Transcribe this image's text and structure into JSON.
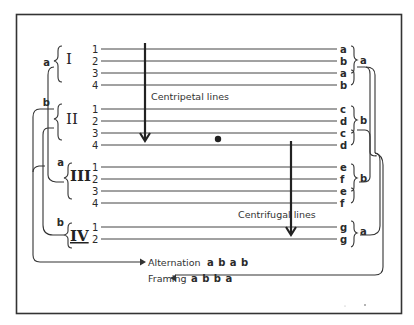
{
  "diagram": {
    "title": "",
    "groups": [
      {
        "roman": "I",
        "left_label": "a",
        "lines": [
          "1",
          "2",
          "3",
          "4"
        ],
        "rhymes": [
          "a",
          "b",
          "a",
          "b"
        ],
        "right_label": "a"
      },
      {
        "roman": "II",
        "left_label": "b",
        "lines": [
          "1",
          "2",
          "3",
          "4"
        ],
        "rhymes": [
          "c",
          "d",
          "c",
          "d"
        ],
        "right_label": "b"
      },
      {
        "roman": "III",
        "left_label": "a",
        "lines": [
          "1",
          "2",
          "3",
          "4"
        ],
        "rhymes": [
          "e",
          "f",
          "e",
          "f"
        ],
        "right_label": "b"
      },
      {
        "roman": "IV",
        "left_label": "b",
        "lines": [
          "1",
          "2"
        ],
        "rhymes": [
          "g",
          "g"
        ],
        "right_label": "a"
      }
    ],
    "annotations": {
      "centripetal": "Centripetal lines",
      "centrifugal": "Centrifugal lines"
    },
    "legend": {
      "alternation_label": "Alternation",
      "alternation_pattern": "a b a b",
      "framing_label": "Framing",
      "framing_pattern": "a b b a"
    },
    "colors": {
      "ink": "#2a2a2a",
      "paper": "#ffffff"
    }
  }
}
